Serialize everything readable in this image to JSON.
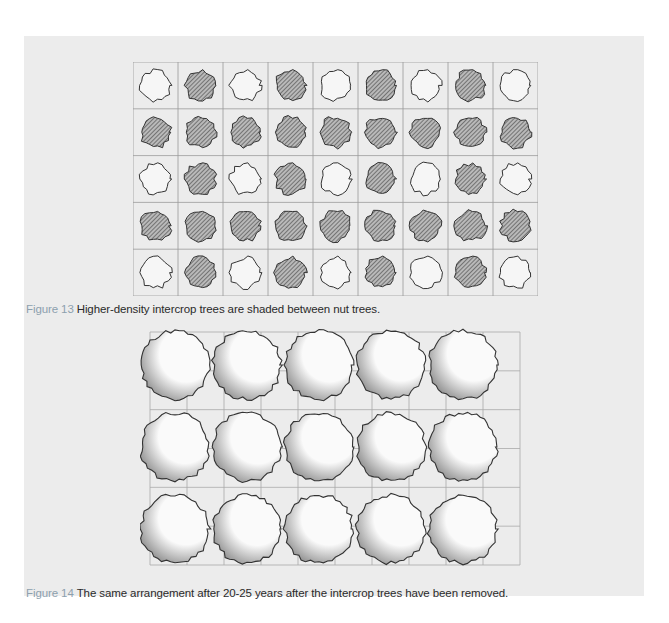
{
  "figures": [
    {
      "id": "figure-13",
      "label": "Figure 13",
      "caption": "Higher-density intercrop trees are shaded between nut trees.",
      "grid": {
        "rows": 5,
        "cols": 9,
        "pattern_description": "Rows 1,3,5 alternate open (nut) and shaded (intercrop) trees; rows 2,4 are all shaded intercrop trees",
        "cells": [
          [
            "open",
            "shaded",
            "open",
            "shaded",
            "open",
            "shaded",
            "open",
            "shaded",
            "open"
          ],
          [
            "shaded",
            "shaded",
            "shaded",
            "shaded",
            "shaded",
            "shaded",
            "shaded",
            "shaded",
            "shaded"
          ],
          [
            "open",
            "shaded",
            "open",
            "shaded",
            "open",
            "shaded",
            "open",
            "shaded",
            "open"
          ],
          [
            "shaded",
            "shaded",
            "shaded",
            "shaded",
            "shaded",
            "shaded",
            "shaded",
            "shaded",
            "shaded"
          ],
          [
            "open",
            "shaded",
            "open",
            "shaded",
            "open",
            "shaded",
            "open",
            "shaded",
            "open"
          ]
        ]
      }
    },
    {
      "id": "figure-14",
      "label": "Figure 14",
      "caption": "The same arrangement after 20-25 years after the intercrop trees have been removed.",
      "grid": {
        "rows": 3,
        "cols": 5,
        "tree_style": "large mature canopy"
      }
    }
  ],
  "colors": {
    "page_bg": "#ececec",
    "label": "#8ca0ae",
    "text": "#2a2a2a",
    "ink": "#3a3a3a"
  }
}
